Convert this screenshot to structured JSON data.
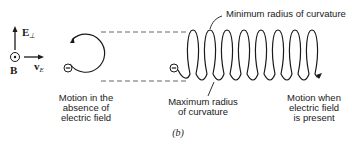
{
  "figure": {
    "panel_label": "(b)",
    "axes": {
      "e_field_label": "E",
      "e_field_subscript": "⊥",
      "b_field_label": "B",
      "drift_velocity_label": "v",
      "drift_velocity_subscript": "E"
    },
    "left_panel": {
      "caption": "Motion in the\nabsence of\nelectric field",
      "particle_symbol": "⊖"
    },
    "right_panel": {
      "top_annotation": "Minimum radius of curvature",
      "bottom_annotation": "Maximum radius\nof curvature",
      "caption": "Motion when\nelectric field\nis present",
      "particle_symbol": "⊖",
      "loop_count": 8
    },
    "colors": {
      "ink": "#1a1a1a",
      "dashed_guides": "#555555",
      "background": "#ffffff"
    }
  }
}
